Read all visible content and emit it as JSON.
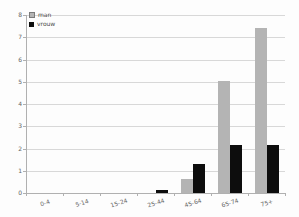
{
  "chart_data": {
    "type": "bar",
    "title": "",
    "xlabel": "",
    "ylabel": "",
    "categories": [
      "0-4",
      "5-14",
      "15-24",
      "25-44",
      "45-64",
      "65-74",
      "75+"
    ],
    "series": [
      {
        "name": "man",
        "color": "#b4b4b4",
        "values": [
          0,
          0,
          0,
          0,
          0.65,
          5.05,
          7.4
        ]
      },
      {
        "name": "vrouw",
        "color": "#0d0d0d",
        "values": [
          0,
          0,
          0,
          0.15,
          1.3,
          2.15,
          2.15
        ]
      }
    ],
    "ylim": [
      0,
      8
    ],
    "yticks": [
      0,
      1,
      2,
      3,
      4,
      5,
      6,
      7,
      8
    ],
    "grid": true,
    "legend_position": "top-left"
  },
  "colors": {
    "gridline": "#d8d8d8",
    "axis": "#b0b0b0",
    "tick_label": "#646464"
  }
}
